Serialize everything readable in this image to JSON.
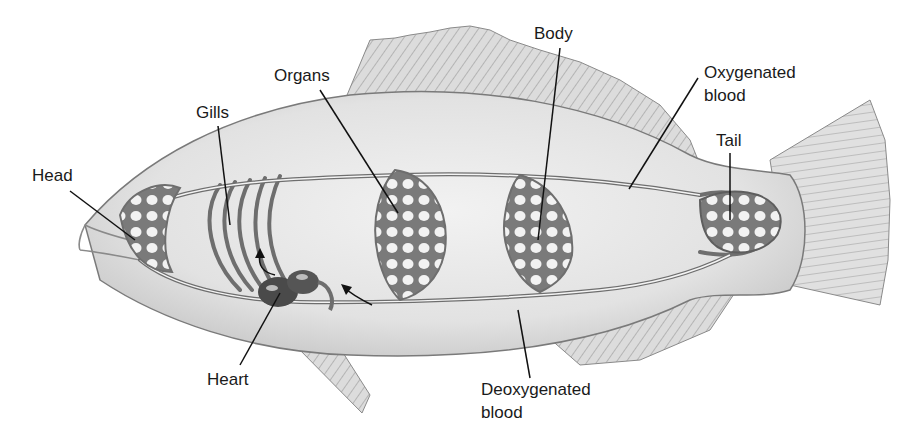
{
  "diagram": {
    "labels": {
      "head": "Head",
      "gills": "Gills",
      "organs": "Organs",
      "body": "Body",
      "oxygenated_line1": "Oxygenated",
      "oxygenated_line2": "blood",
      "tail": "Tail",
      "heart": "Heart",
      "deoxygenated_line1": "Deoxygenated",
      "deoxygenated_line2": "blood"
    },
    "colors": {
      "background": "#ffffff",
      "body_fill": "#e6e6e6",
      "vessel": "#6e6e6e",
      "heart": "#4a4a4a",
      "fin": "#d4d4d4",
      "leader_line": "#111111",
      "text": "#1a1a1a"
    }
  }
}
